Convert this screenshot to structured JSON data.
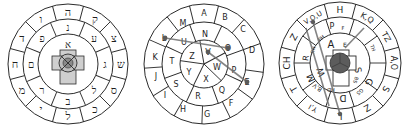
{
  "figure": {
    "wheels": [
      {
        "id": "hebrew-wheel",
        "outer_ring": [
          "ה",
          "ק",
          "צ",
          "ש",
          "ס",
          "כ",
          "ל",
          "י",
          "מ",
          "ח",
          "ד",
          "ו"
        ],
        "middle_ring": [
          "נ",
          "ע",
          "ג",
          "ל",
          "ב",
          "ר",
          "ם",
          "פ"
        ],
        "inner_ring": [
          "א"
        ],
        "center": "cross"
      },
      {
        "id": "latin-wheel",
        "outer_ring": [
          "A",
          "B",
          "C",
          "D",
          "E",
          "F",
          "G",
          "H",
          "I",
          "J",
          "K",
          "L",
          "M"
        ],
        "middle_ring": [
          "N",
          "O",
          "P",
          "Q",
          "R",
          "S",
          "T",
          "U"
        ],
        "inner_ring": [
          "V",
          "W",
          "X",
          "Y",
          "Z"
        ],
        "connections": [
          [
            "L",
            "O"
          ],
          [
            "V",
            "E"
          ]
        ]
      },
      {
        "id": "mixed-wheel",
        "outer_ring": [
          "H",
          "K,Q",
          "TZ",
          "A,O",
          "S",
          "Z",
          "L",
          "Y,I",
          "T",
          "CH",
          "Z",
          "V,O,U"
        ],
        "middle_ring": [
          "P",
          "F",
          "TH",
          "G",
          "GS",
          "D",
          "M",
          "B,V",
          "R",
          "RH",
          "PH"
        ],
        "inner_ring": [
          "A",
          "E",
          "S",
          "BS",
          "HD",
          "W"
        ],
        "center": "cross",
        "connections": [
          [
            "V,O,U",
            "L"
          ],
          [
            "K,Q",
            "BS"
          ]
        ]
      }
    ]
  }
}
